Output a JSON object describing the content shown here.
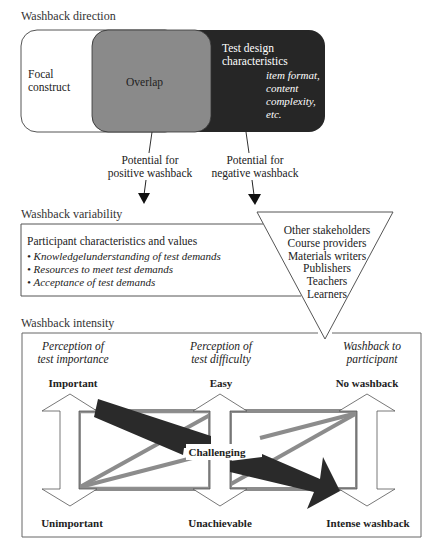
{
  "sections": {
    "direction": {
      "title": "Washback direction",
      "focal_construct": [
        "Focal",
        "construct"
      ],
      "overlap": "Overlap",
      "test_design": [
        "Test design",
        "characteristics"
      ],
      "test_design_examples": [
        "item format,",
        "content",
        "complexity,",
        "etc."
      ],
      "positive": [
        "Potential for",
        "positive washback"
      ],
      "negative": [
        "Potential for",
        "negative washback"
      ]
    },
    "variability": {
      "title": "Washback variability",
      "box_heading": "Participant characteristics and values",
      "items": [
        "Knowledgelunderstanding of test demands",
        "Resources to meet test demands",
        "Acceptance of test demands"
      ],
      "bullet": "•",
      "stakeholders": [
        "Other stakeholders",
        "Course providers",
        "Materials writers",
        "Publishers",
        "Teachers",
        "Learners"
      ]
    },
    "intensity": {
      "title": "Washback intensity",
      "columns": [
        {
          "heading": [
            "Perception of",
            "test importance"
          ],
          "top": "Important",
          "bottom": "Unimportant"
        },
        {
          "heading": [
            "Perception of",
            "test difficulty"
          ],
          "top": "Easy",
          "bottom": "Unachievable"
        },
        {
          "heading": [
            "Washback to",
            "participant"
          ],
          "top": "No washback",
          "bottom": "Intense washback"
        }
      ],
      "middle_label": "Challenging"
    }
  },
  "colors": {
    "overlap_fill": "#8a8a8a",
    "test_design_fill": "#262626",
    "gray_bar": "#8c8c8c",
    "black_arrow": "#2a2a2a",
    "outline": "#555555"
  }
}
